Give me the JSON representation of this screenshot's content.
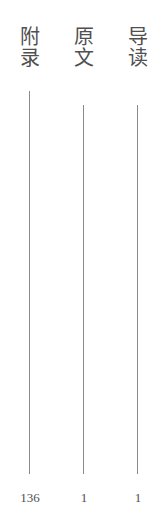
{
  "columns": [
    {
      "title_chars": [
        "附",
        "录"
      ],
      "title": "附录",
      "count": "136",
      "line_top": 91,
      "line_bottom": 474
    },
    {
      "title_chars": [
        "原",
        "文"
      ],
      "title": "原文",
      "count": "1",
      "line_top": 105,
      "line_bottom": 474
    },
    {
      "title_chars": [
        "导",
        "读"
      ],
      "title": "导读",
      "count": "1",
      "line_top": 105,
      "line_bottom": 474
    }
  ],
  "colors": {
    "text": "#505050",
    "line": "#8a8a8a",
    "background": "#ffffff"
  }
}
